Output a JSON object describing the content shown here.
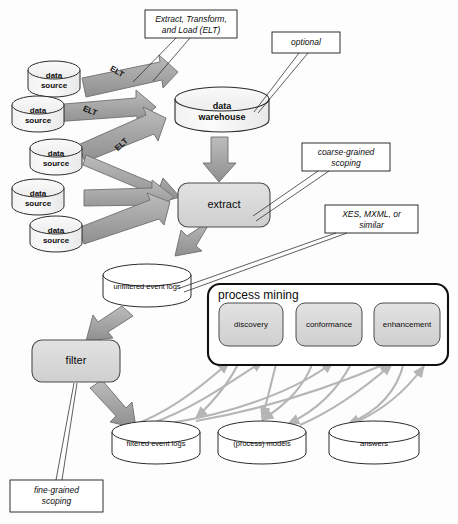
{
  "diagram": {
    "colors": {
      "arrow_fill": "#a6a6a6",
      "arrow_stroke": "#6e6e6e",
      "box_fill": "#d9d9d9",
      "box_stroke": "#4d4d4d",
      "cylinder_fill": "#f5f5f5",
      "cylinder_stroke": "#2b2b2b",
      "note_stroke": "#1a1a1a",
      "curve_stroke": "#b5b5b5",
      "frame_stroke": "#101010",
      "page_bg": "#ffffff"
    }
  },
  "sources": {
    "label_line1": "data",
    "label_line2": "source",
    "count": 5,
    "items": [
      {
        "line1": "data",
        "line2": "source"
      },
      {
        "line1": "data",
        "line2": "source"
      },
      {
        "line1": "data",
        "line2": "source"
      },
      {
        "line1": "data",
        "line2": "source"
      },
      {
        "line1": "data",
        "line2": "source"
      }
    ]
  },
  "elt_arrows": [
    {
      "label": "ELT"
    },
    {
      "label": "ELT"
    },
    {
      "label": "ELT"
    }
  ],
  "warehouse": {
    "line1": "data",
    "line2": "warehouse"
  },
  "extract": {
    "label": "extract"
  },
  "unfiltered_logs": {
    "label": "unfiltered event logs"
  },
  "filter": {
    "label": "filter"
  },
  "process_mining": {
    "title": "process mining",
    "boxes": [
      {
        "label": "discovery"
      },
      {
        "label": "conformance"
      },
      {
        "label": "enhancement"
      }
    ]
  },
  "outputs": [
    {
      "label": "filtered event logs"
    },
    {
      "label": "(process) models"
    },
    {
      "label": "answers"
    }
  ],
  "notes": [
    {
      "id": "etl-note",
      "line1": "Extract, Transform,",
      "line2": "and Load (ELT)"
    },
    {
      "id": "optional-note",
      "line1": "optional",
      "line2": ""
    },
    {
      "id": "coarse-note",
      "line1": "coarse-grained",
      "line2": "scoping"
    },
    {
      "id": "xes-note",
      "line1": "XES, MXML, or",
      "line2": "similar"
    },
    {
      "id": "fine-note",
      "line1": "fine-grained",
      "line2": "scoping"
    }
  ]
}
